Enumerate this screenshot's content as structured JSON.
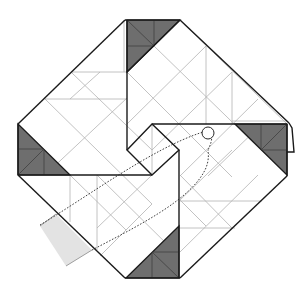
{
  "diagram": {
    "colors": {
      "paper": "#ffffff",
      "edge": "#1a1a1a",
      "crease": "#b3b3b3",
      "shaded_corner": "#6e6e6e",
      "flap_fill": "#e3e3e3"
    },
    "elements": {
      "outline": "octagonal folded paper with pinwheel center",
      "shaded_corners": [
        "top",
        "left",
        "right",
        "bottom"
      ],
      "light_flap": "bottom-left",
      "dotted_path": "tuck/insert arrow path from bottom-left toward center",
      "ring_marker": "circle near center-right indicating grip point"
    }
  }
}
